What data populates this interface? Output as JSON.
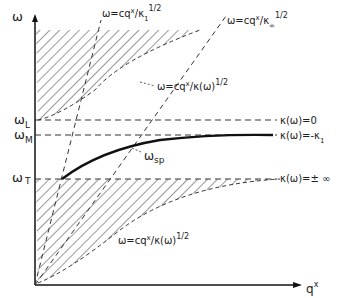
{
  "axes": {
    "y_label": "ω",
    "x_label": "q",
    "x_label_sup": "x"
  },
  "levels": {
    "omega_L": "ω",
    "omega_L_sub": "L",
    "omega_M": "ω",
    "omega_M_sub": "M",
    "omega_T": "ω",
    "omega_T_sub": "T"
  },
  "right_labels": {
    "kappa_zero": "κ(ω)=0",
    "kappa_minus": "κ(ω)=-κ",
    "kappa_minus_sub": "1",
    "kappa_inf": "κ(ω)=± ∞"
  },
  "line_labels": {
    "light_line_1": "ω=cq",
    "light_line_1_rest": "/κ",
    "light_line_1_sub": "1",
    "light_line_1_exp": "1/2",
    "light_line_inf": "ω=cq",
    "light_line_inf_rest": "/κ",
    "light_line_inf_sub": "∞",
    "light_line_inf_exp": "1/2",
    "upper_curve": "ω=cq",
    "upper_curve_rest": "/κ(ω)",
    "upper_curve_exp": "1/2",
    "lower_curve": "ω=cq",
    "lower_curve_rest": "/κ(ω)",
    "lower_curve_exp": "1/2",
    "sup_x": "x"
  },
  "surface_mode": {
    "label": "ω",
    "label_sub": "sp"
  }
}
